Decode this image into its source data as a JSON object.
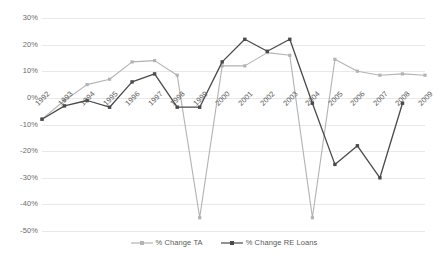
{
  "chart_data": {
    "type": "line",
    "title": "",
    "xlabel": "",
    "ylabel": "",
    "categories": [
      "1992",
      "1993",
      "1994",
      "1995",
      "1996",
      "1997",
      "1998",
      "1999",
      "2000",
      "2001",
      "2002",
      "2003",
      "2004",
      "2005",
      "2006",
      "2007",
      "2008",
      "2009"
    ],
    "ylim": [
      -50,
      30
    ],
    "ytick_labels": [
      "30%",
      "20%",
      "10%",
      "0%",
      "-10%",
      "-20%",
      "-30%",
      "-40%",
      "-50%"
    ],
    "ytick_values": [
      30,
      20,
      10,
      0,
      -10,
      -20,
      -30,
      -40,
      -50
    ],
    "grid": true,
    "legend_position": "bottom-center",
    "series": [
      {
        "name": "% Change TA",
        "color": "#b3b3b3",
        "marker": "square",
        "values": [
          -8,
          -1,
          5,
          7,
          13.5,
          14,
          8.5,
          -45,
          12,
          12,
          17,
          16,
          -45,
          14.5,
          10,
          8.5,
          9,
          8.5
        ]
      },
      {
        "name": "% Change RE Loans",
        "color": "#4a4a4a",
        "marker": "square",
        "values": [
          -8,
          -3,
          -1,
          -3.5,
          6,
          9,
          -3.5,
          -3.5,
          13.5,
          22,
          17.5,
          22,
          -2,
          -25,
          -18,
          -30,
          -2,
          null
        ]
      }
    ]
  },
  "legend": {
    "items": [
      {
        "label": "% Change TA",
        "color": "#b3b3b3"
      },
      {
        "label": "% Change RE Loans",
        "color": "#4a4a4a"
      }
    ]
  },
  "colors": {
    "gridline": "#e8e8e8",
    "axis_text": "#5a5a5a",
    "background": "#ffffff",
    "series_ta": "#b3b3b3",
    "series_re_loans": "#4a4a4a"
  }
}
